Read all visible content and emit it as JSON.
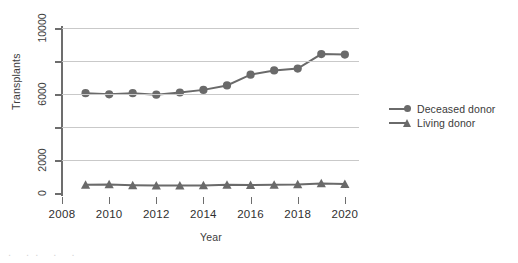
{
  "chart_data": {
    "type": "line",
    "title": "",
    "xlabel": "Year",
    "ylabel": "Transplants",
    "x": [
      2009,
      2010,
      2011,
      2012,
      2013,
      2014,
      2015,
      2016,
      2017,
      2018,
      2019,
      2020
    ],
    "xlim": [
      2008,
      2020.6
    ],
    "ylim": [
      0,
      10000
    ],
    "x_ticks": [
      2008,
      2010,
      2012,
      2014,
      2016,
      2018,
      2020
    ],
    "x_tick_labels": [
      "2008",
      "2010",
      "2012",
      "2014",
      "2016",
      "2018",
      "2020"
    ],
    "y_ticks": [
      0,
      2000,
      4000,
      6000,
      8000,
      10000
    ],
    "y_tick_labels": [
      "0",
      "2000",
      "",
      "6000",
      "",
      "10000"
    ],
    "grid": true,
    "grid_axis": "y",
    "legend_position": "right",
    "series": [
      {
        "name": "Deceased donor",
        "marker": "circle",
        "color": "#6a6a6a",
        "values": [
          6050,
          5980,
          6050,
          5960,
          6090,
          6250,
          6520,
          7170,
          7430,
          7540,
          8420,
          8390
        ]
      },
      {
        "name": "Living donor",
        "marker": "triangle",
        "color": "#6a6a6a",
        "values": [
          500,
          520,
          470,
          450,
          450,
          460,
          500,
          480,
          500,
          520,
          580,
          540
        ]
      }
    ]
  },
  "axes": {
    "y_title": "Transplants",
    "x_title": "Year"
  },
  "legend": {
    "items": [
      {
        "label": "Deceased donor",
        "marker": "circle"
      },
      {
        "label": "Living donor",
        "marker": "triangle"
      }
    ]
  },
  "artifact": {
    "text": ". ..  .   ."
  },
  "colors": {
    "series": "#6a6a6a",
    "axis": "#6d6d6d",
    "grid": "#c9c9c9",
    "text": "#3d3d3d",
    "background": "#ffffff"
  }
}
